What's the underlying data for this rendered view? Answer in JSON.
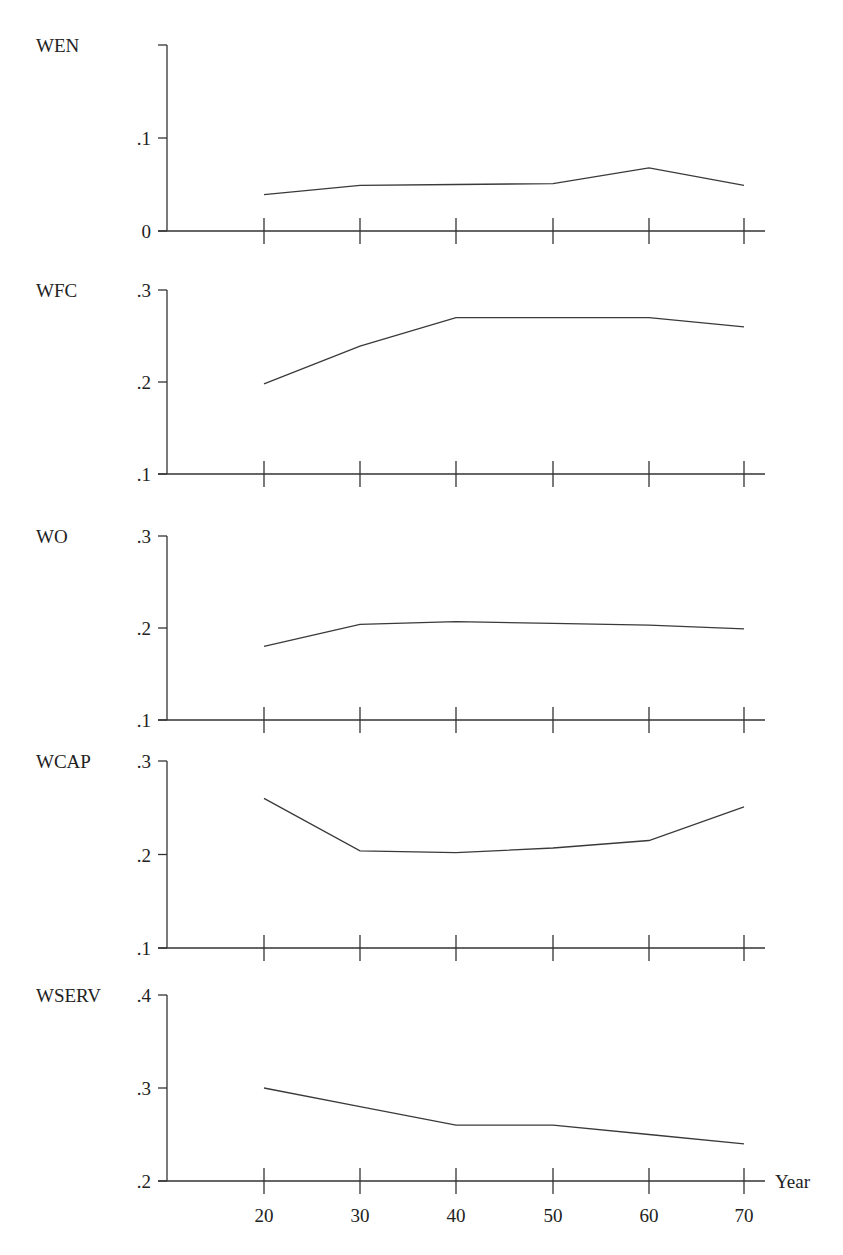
{
  "chart_data": {
    "type": "line",
    "title": "",
    "xlabel": "Year",
    "x": [
      20,
      30,
      40,
      50,
      60,
      70
    ],
    "x_tick_labels": [
      "20",
      "30",
      "40",
      "50",
      "60",
      "70"
    ],
    "panels": [
      {
        "name": "WEN",
        "ylabel": "WEN",
        "y_ticks": [
          0,
          0.1,
          0.2
        ],
        "y_tick_labels": [
          "0",
          ".1",
          ""
        ],
        "ylim": [
          0,
          0.2
        ],
        "values": [
          0.039,
          0.049,
          0.05,
          0.051,
          0.068,
          0.049
        ]
      },
      {
        "name": "WFC",
        "ylabel": "WFC",
        "y_ticks": [
          0.1,
          0.2,
          0.3
        ],
        "y_tick_labels": [
          ".1",
          ".2",
          ".3"
        ],
        "ylim": [
          0.1,
          0.3
        ],
        "values": [
          0.198,
          0.239,
          0.27,
          0.27,
          0.27,
          0.26
        ]
      },
      {
        "name": "WO",
        "ylabel": "WO",
        "y_ticks": [
          0.1,
          0.2,
          0.3
        ],
        "y_tick_labels": [
          ".1",
          ".2",
          ".3"
        ],
        "ylim": [
          0.1,
          0.3
        ],
        "values": [
          0.18,
          0.204,
          0.207,
          0.205,
          0.203,
          0.199
        ]
      },
      {
        "name": "WCAP",
        "ylabel": "WCAP",
        "y_ticks": [
          0.1,
          0.2,
          0.3
        ],
        "y_tick_labels": [
          ".1",
          ".2",
          ".3"
        ],
        "ylim": [
          0.1,
          0.3
        ],
        "values": [
          0.26,
          0.204,
          0.202,
          0.207,
          0.215,
          0.251
        ]
      },
      {
        "name": "WSERV",
        "ylabel": "WSERV",
        "y_ticks": [
          0.2,
          0.3,
          0.4
        ],
        "y_tick_labels": [
          ".2",
          ".3",
          ".4"
        ],
        "ylim": [
          0.2,
          0.4
        ],
        "values": [
          0.3,
          0.28,
          0.26,
          0.26,
          0.25,
          0.24
        ]
      }
    ],
    "grid": false,
    "legend": null
  },
  "layout_hints": {
    "axis_x": 167,
    "x_positions": [
      264,
      360,
      456,
      553,
      649,
      744
    ],
    "axis_right": 765,
    "panel_pixels": [
      {
        "ymin_px": 231,
        "ymax_px": 45
      },
      {
        "ymin_px": 474,
        "ymax_px": 290
      },
      {
        "ymin_px": 720,
        "ymax_px": 536
      },
      {
        "ymin_px": 948,
        "ymax_px": 761
      },
      {
        "ymin_px": 1181,
        "ymax_px": 995
      }
    ]
  }
}
